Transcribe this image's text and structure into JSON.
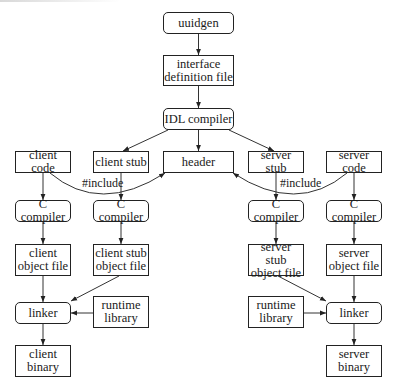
{
  "diagram": {
    "nodes": [
      {
        "id": "uuidgen",
        "label": "uuidgen",
        "shape": "rounded",
        "x": 163,
        "y": 12,
        "w": 71,
        "h": 22
      },
      {
        "id": "idl_file",
        "label": "interface\ndefinition file",
        "shape": "rect",
        "x": 163,
        "y": 55,
        "w": 71,
        "h": 31
      },
      {
        "id": "idl_compiler",
        "label": "IDL compiler",
        "shape": "rounded",
        "x": 163,
        "y": 108,
        "w": 71,
        "h": 22
      },
      {
        "id": "client_code",
        "label": "client code",
        "shape": "rect",
        "x": 15,
        "y": 151,
        "w": 56,
        "h": 22
      },
      {
        "id": "client_stub",
        "label": "client stub",
        "shape": "rect",
        "x": 93,
        "y": 151,
        "w": 56,
        "h": 22
      },
      {
        "id": "header",
        "label": "header",
        "shape": "rect",
        "x": 163,
        "y": 151,
        "w": 71,
        "h": 22
      },
      {
        "id": "server_stub",
        "label": "server stub",
        "shape": "rect",
        "x": 248,
        "y": 151,
        "w": 56,
        "h": 22
      },
      {
        "id": "server_code",
        "label": "server code",
        "shape": "rect",
        "x": 326,
        "y": 151,
        "w": 56,
        "h": 22
      },
      {
        "id": "client_cc",
        "label": "C compiler",
        "shape": "rounded",
        "x": 15,
        "y": 200,
        "w": 56,
        "h": 22
      },
      {
        "id": "client_stub_cc",
        "label": "C compiler",
        "shape": "rounded",
        "x": 93,
        "y": 200,
        "w": 56,
        "h": 22
      },
      {
        "id": "server_stub_cc",
        "label": "C compiler",
        "shape": "rounded",
        "x": 248,
        "y": 200,
        "w": 56,
        "h": 22
      },
      {
        "id": "server_cc",
        "label": "C compiler",
        "shape": "rounded",
        "x": 326,
        "y": 200,
        "w": 56,
        "h": 22
      },
      {
        "id": "client_obj",
        "label": "client\nobject file",
        "shape": "rect",
        "x": 15,
        "y": 244,
        "w": 56,
        "h": 32
      },
      {
        "id": "client_stub_obj",
        "label": "client stub\nobject file",
        "shape": "rect",
        "x": 93,
        "y": 244,
        "w": 56,
        "h": 32
      },
      {
        "id": "server_stub_obj",
        "label": "server stub\nobject file",
        "shape": "rect",
        "x": 248,
        "y": 244,
        "w": 56,
        "h": 32
      },
      {
        "id": "server_obj",
        "label": "server\nobject file",
        "shape": "rect",
        "x": 326,
        "y": 244,
        "w": 56,
        "h": 32
      },
      {
        "id": "client_linker",
        "label": "linker",
        "shape": "rounded",
        "x": 15,
        "y": 302,
        "w": 56,
        "h": 22
      },
      {
        "id": "client_runtime",
        "label": "runtime\nlibrary",
        "shape": "rect",
        "x": 93,
        "y": 296,
        "w": 56,
        "h": 32
      },
      {
        "id": "server_runtime",
        "label": "runtime\nlibrary",
        "shape": "rect",
        "x": 248,
        "y": 296,
        "w": 56,
        "h": 32
      },
      {
        "id": "server_linker",
        "label": "linker",
        "shape": "rounded",
        "x": 326,
        "y": 302,
        "w": 56,
        "h": 22
      },
      {
        "id": "client_binary",
        "label": "client\nbinary",
        "shape": "rect",
        "x": 15,
        "y": 345,
        "w": 56,
        "h": 32
      },
      {
        "id": "server_binary",
        "label": "server\nbinary",
        "shape": "rect",
        "x": 326,
        "y": 345,
        "w": 56,
        "h": 32
      }
    ],
    "edges": [
      {
        "from": "uuidgen",
        "to": "idl_file"
      },
      {
        "from": "idl_file",
        "to": "idl_compiler"
      },
      {
        "from": "idl_compiler",
        "to": "client_stub"
      },
      {
        "from": "idl_compiler",
        "to": "header"
      },
      {
        "from": "idl_compiler",
        "to": "server_stub"
      },
      {
        "from": "client_code",
        "to": "client_cc"
      },
      {
        "from": "client_stub",
        "to": "client_stub_cc"
      },
      {
        "from": "server_stub",
        "to": "server_stub_cc"
      },
      {
        "from": "server_code",
        "to": "server_cc"
      },
      {
        "from": "client_cc",
        "to": "client_obj"
      },
      {
        "from": "client_stub_cc",
        "to": "client_stub_obj"
      },
      {
        "from": "server_stub_cc",
        "to": "server_stub_obj"
      },
      {
        "from": "server_cc",
        "to": "server_obj"
      },
      {
        "from": "client_obj",
        "to": "client_linker"
      },
      {
        "from": "client_stub_obj",
        "to": "client_linker"
      },
      {
        "from": "client_runtime",
        "to": "client_linker"
      },
      {
        "from": "server_stub_obj",
        "to": "server_linker"
      },
      {
        "from": "server_obj",
        "to": "server_linker"
      },
      {
        "from": "server_runtime",
        "to": "server_linker"
      },
      {
        "from": "client_linker",
        "to": "client_binary"
      },
      {
        "from": "server_linker",
        "to": "server_binary"
      },
      {
        "from": "client_code",
        "to": "header",
        "label": "#include",
        "curved": true
      },
      {
        "from": "server_code",
        "to": "header",
        "label": "#include",
        "curved": true
      }
    ],
    "edge_labels": [
      {
        "text": "#include",
        "x": 82,
        "y": 176
      },
      {
        "text": "#include",
        "x": 280,
        "y": 176
      }
    ]
  }
}
